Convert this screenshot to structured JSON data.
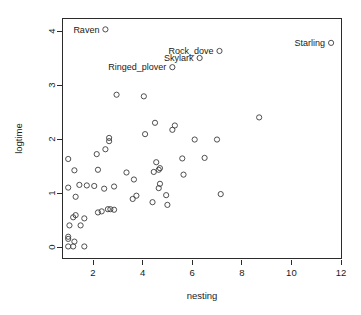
{
  "chart_data": {
    "type": "scatter",
    "title": "",
    "xlabel": "nesting",
    "ylabel": "logtime",
    "xlim": [
      0.75,
      12.0
    ],
    "ylim": [
      -0.12,
      4.15
    ],
    "xticks": [
      2,
      4,
      6,
      8,
      10,
      12
    ],
    "yticks": [
      0,
      1,
      2,
      3,
      4
    ],
    "grid": false,
    "legend": null,
    "marker": "open-circle",
    "points": [
      {
        "x": 2.5,
        "y": 4.03,
        "label": "Raven"
      },
      {
        "x": 11.6,
        "y": 3.78,
        "label": "Starling"
      },
      {
        "x": 7.1,
        "y": 3.63,
        "label": "Rock_dove"
      },
      {
        "x": 6.3,
        "y": 3.5,
        "label": "Skylark"
      },
      {
        "x": 5.2,
        "y": 3.33,
        "label": "Ringed_plover"
      },
      {
        "x": 2.95,
        "y": 2.82,
        "label": ""
      },
      {
        "x": 4.05,
        "y": 2.79,
        "label": ""
      },
      {
        "x": 8.7,
        "y": 2.4,
        "label": ""
      },
      {
        "x": 4.5,
        "y": 2.3,
        "label": ""
      },
      {
        "x": 5.3,
        "y": 2.25,
        "label": ""
      },
      {
        "x": 5.2,
        "y": 2.17,
        "label": ""
      },
      {
        "x": 4.1,
        "y": 2.09,
        "label": ""
      },
      {
        "x": 2.65,
        "y": 2.02,
        "label": ""
      },
      {
        "x": 2.65,
        "y": 1.96,
        "label": ""
      },
      {
        "x": 6.1,
        "y": 1.99,
        "label": ""
      },
      {
        "x": 7.0,
        "y": 1.99,
        "label": ""
      },
      {
        "x": 2.5,
        "y": 1.81,
        "label": ""
      },
      {
        "x": 2.15,
        "y": 1.72,
        "label": ""
      },
      {
        "x": 1.0,
        "y": 1.63,
        "label": ""
      },
      {
        "x": 5.6,
        "y": 1.64,
        "label": ""
      },
      {
        "x": 6.5,
        "y": 1.65,
        "label": ""
      },
      {
        "x": 4.55,
        "y": 1.57,
        "label": ""
      },
      {
        "x": 4.7,
        "y": 1.46,
        "label": ""
      },
      {
        "x": 4.65,
        "y": 1.43,
        "label": ""
      },
      {
        "x": 2.2,
        "y": 1.43,
        "label": ""
      },
      {
        "x": 1.25,
        "y": 1.42,
        "label": ""
      },
      {
        "x": 4.45,
        "y": 1.39,
        "label": ""
      },
      {
        "x": 3.35,
        "y": 1.38,
        "label": ""
      },
      {
        "x": 5.65,
        "y": 1.34,
        "label": ""
      },
      {
        "x": 3.65,
        "y": 1.25,
        "label": ""
      },
      {
        "x": 4.7,
        "y": 1.17,
        "label": ""
      },
      {
        "x": 4.65,
        "y": 1.09,
        "label": ""
      },
      {
        "x": 1.0,
        "y": 1.1,
        "label": ""
      },
      {
        "x": 1.45,
        "y": 1.15,
        "label": ""
      },
      {
        "x": 1.75,
        "y": 1.14,
        "label": ""
      },
      {
        "x": 2.05,
        "y": 1.13,
        "label": ""
      },
      {
        "x": 2.85,
        "y": 1.12,
        "label": ""
      },
      {
        "x": 2.45,
        "y": 1.08,
        "label": ""
      },
      {
        "x": 7.15,
        "y": 0.98,
        "label": ""
      },
      {
        "x": 4.95,
        "y": 0.96,
        "label": ""
      },
      {
        "x": 3.75,
        "y": 0.95,
        "label": ""
      },
      {
        "x": 1.3,
        "y": 0.93,
        "label": ""
      },
      {
        "x": 3.6,
        "y": 0.89,
        "label": ""
      },
      {
        "x": 4.4,
        "y": 0.83,
        "label": ""
      },
      {
        "x": 5.0,
        "y": 0.78,
        "label": ""
      },
      {
        "x": 2.6,
        "y": 0.7,
        "label": ""
      },
      {
        "x": 2.7,
        "y": 0.7,
        "label": ""
      },
      {
        "x": 2.85,
        "y": 0.69,
        "label": ""
      },
      {
        "x": 2.35,
        "y": 0.66,
        "label": ""
      },
      {
        "x": 2.2,
        "y": 0.64,
        "label": ""
      },
      {
        "x": 1.3,
        "y": 0.59,
        "label": ""
      },
      {
        "x": 1.2,
        "y": 0.55,
        "label": ""
      },
      {
        "x": 1.65,
        "y": 0.53,
        "label": ""
      },
      {
        "x": 1.05,
        "y": 0.4,
        "label": ""
      },
      {
        "x": 1.5,
        "y": 0.4,
        "label": ""
      },
      {
        "x": 1.0,
        "y": 0.19,
        "label": ""
      },
      {
        "x": 1.0,
        "y": 0.15,
        "label": ""
      },
      {
        "x": 1.25,
        "y": 0.1,
        "label": ""
      },
      {
        "x": 1.0,
        "y": 0.01,
        "label": ""
      },
      {
        "x": 1.2,
        "y": 0.01,
        "label": ""
      },
      {
        "x": 1.65,
        "y": 0.01,
        "label": ""
      }
    ],
    "labeled_points": [
      {
        "name": "Raven",
        "x": 2.5,
        "y": 4.03
      },
      {
        "name": "Starling",
        "x": 11.6,
        "y": 3.78
      },
      {
        "name": "Rock_dove",
        "x": 7.1,
        "y": 3.63
      },
      {
        "name": "Skylark",
        "x": 6.3,
        "y": 3.5
      },
      {
        "name": "Ringed_plover",
        "x": 5.2,
        "y": 3.33
      }
    ],
    "colors": {
      "marker_stroke": "#3c3c3c",
      "axis": "#2b2b2b",
      "text": "#1a1a1a",
      "background": "#ffffff"
    }
  }
}
